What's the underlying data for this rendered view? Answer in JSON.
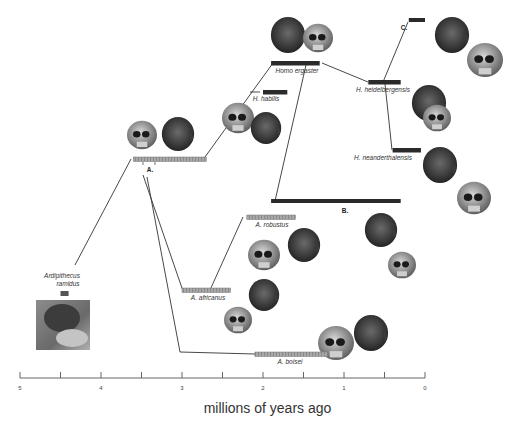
{
  "chart_data": {
    "type": "phylogeny-timeline",
    "title": "",
    "xlabel": "millions of years ago",
    "xlim": [
      5,
      0
    ],
    "x_ticks": [
      5,
      4.5,
      4,
      3.5,
      3,
      2.5,
      2,
      1.5,
      1,
      0.5,
      0
    ],
    "x_tick_labels": [
      "5",
      "4",
      "3",
      "2",
      "1",
      "0"
    ],
    "x_tick_label_values": [
      5,
      4,
      3,
      2,
      1,
      0
    ],
    "species": [
      {
        "id": "ramidus",
        "label": "Ardipithecus ramidus",
        "start": 4.5,
        "end": 4.4,
        "style": "grey",
        "has_photo": true
      },
      {
        "id": "groupA",
        "label": "A.",
        "start": 3.6,
        "end": 2.7,
        "style": "hatched",
        "clade": true
      },
      {
        "id": "africanus",
        "label": "A. africanus",
        "start": 3.0,
        "end": 2.4,
        "style": "hatched"
      },
      {
        "id": "robustus",
        "label": "A. robustus",
        "start": 2.2,
        "end": 1.6,
        "style": "hatched"
      },
      {
        "id": "boisei",
        "label": "A. boisei",
        "start": 2.1,
        "end": 1.2,
        "style": "hatched"
      },
      {
        "id": "habilis",
        "label": "H. habilis",
        "start": 2.0,
        "end": 1.7,
        "style": "black"
      },
      {
        "id": "ergaster",
        "label": "Homo ergaster",
        "start": 1.9,
        "end": 1.3,
        "style": "black"
      },
      {
        "id": "groupB",
        "label": "B.",
        "start": 1.9,
        "end": 0.3,
        "style": "black",
        "clade": true
      },
      {
        "id": "heidelbergensis",
        "label": "H. heidelbergensis",
        "start": 0.7,
        "end": 0.3,
        "style": "black"
      },
      {
        "id": "neanderthalensis",
        "label": "H. neanderthalensis",
        "start": 0.4,
        "end": 0.05,
        "style": "black"
      },
      {
        "id": "groupC",
        "label": "C.",
        "start": 0.2,
        "end": 0.0,
        "style": "black",
        "clade": true
      }
    ],
    "links": [
      [
        "ramidus",
        "groupA"
      ],
      [
        "groupA",
        "africanus"
      ],
      [
        "groupA",
        "boisei"
      ],
      [
        "groupA",
        "ergaster"
      ],
      [
        "africanus",
        "robustus"
      ],
      [
        "ergaster",
        "groupB"
      ],
      [
        "ergaster",
        "heidelbergensis"
      ],
      [
        "heidelbergensis",
        "neanderthalensis"
      ],
      [
        "heidelbergensis",
        "groupC"
      ]
    ],
    "illustrations": [
      {
        "near": "groupA",
        "items": [
          "skull",
          "head"
        ]
      },
      {
        "near": "habilis",
        "items": [
          "skull",
          "head"
        ]
      },
      {
        "near": "ergaster",
        "items": [
          "head",
          "skull"
        ]
      },
      {
        "near": "groupC",
        "items": [
          "head",
          "skull"
        ]
      },
      {
        "near": "heidelbergensis",
        "items": [
          "head",
          "skull"
        ]
      },
      {
        "near": "neanderthalensis",
        "items": [
          "head",
          "skull"
        ]
      },
      {
        "near": "robustus",
        "items": [
          "skull",
          "head"
        ]
      },
      {
        "near": "africanus",
        "items": [
          "head",
          "skull"
        ]
      },
      {
        "near": "boisei",
        "items": [
          "skull",
          "head"
        ]
      }
    ]
  },
  "colors": {
    "hatched": "#9c9c9c",
    "black": "#2a2a2a",
    "grey": "#555555",
    "line": "#333333"
  }
}
